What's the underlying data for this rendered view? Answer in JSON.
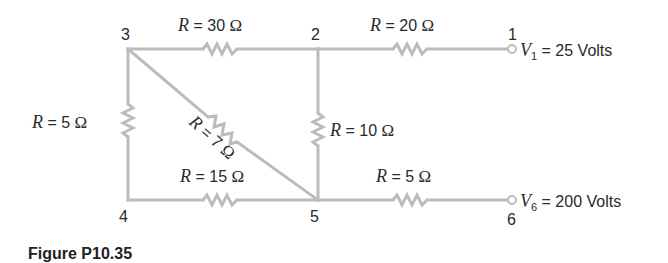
{
  "figure": {
    "caption": "Figure P10.35"
  },
  "nodes": [
    {
      "id": "1",
      "label": "1"
    },
    {
      "id": "2",
      "label": "2"
    },
    {
      "id": "3",
      "label": "3"
    },
    {
      "id": "4",
      "label": "4"
    },
    {
      "id": "5",
      "label": "5"
    },
    {
      "id": "6",
      "label": "6"
    }
  ],
  "resistors": [
    {
      "between": "3-2",
      "symbol": "R",
      "eq": " = ",
      "value": "30",
      "unit": "Ω"
    },
    {
      "between": "2-1",
      "symbol": "R",
      "eq": " = ",
      "value": "20",
      "unit": "Ω"
    },
    {
      "between": "3-4",
      "symbol": "R",
      "eq": " = ",
      "value": "5",
      "unit": "Ω"
    },
    {
      "between": "3-5",
      "symbol": "R",
      "eq": " = ",
      "value": "7",
      "unit": "Ω"
    },
    {
      "between": "2-5",
      "symbol": "R",
      "eq": " = ",
      "value": "10",
      "unit": "Ω"
    },
    {
      "between": "4-5",
      "symbol": "R",
      "eq": " = ",
      "value": "15",
      "unit": "Ω"
    },
    {
      "between": "5-6",
      "symbol": "R",
      "eq": " = ",
      "value": "5",
      "unit": "Ω"
    }
  ],
  "sources": [
    {
      "node": "1",
      "symbol": "V",
      "sub": "1",
      "eq": " = ",
      "value": "25",
      "unit": "Volts"
    },
    {
      "node": "6",
      "symbol": "V",
      "sub": "6",
      "eq": " = ",
      "value": "200",
      "unit": "Volts"
    }
  ],
  "colors": {
    "wire": "#bcbcbc",
    "text": "#2a2a2a"
  }
}
